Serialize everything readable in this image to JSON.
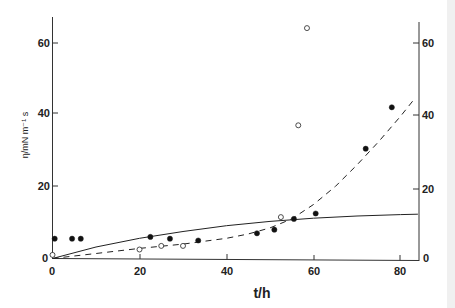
{
  "chart_data": {
    "type": "scatter",
    "title": "",
    "xlabel": "t/h",
    "ylabel": "η/mN m⁻¹ s",
    "xlim": [
      0,
      85
    ],
    "ylim": [
      0,
      68
    ],
    "xticks": [
      "0",
      "20",
      "40",
      "60",
      "80"
    ],
    "yticks_left": [
      "0",
      "20",
      "40",
      "60"
    ],
    "yticks_right": [
      "0",
      "20",
      "40",
      "60"
    ],
    "grid": false,
    "legend": "none",
    "series": [
      {
        "name": "filled circles",
        "marker": "filled-circle",
        "x": [
          0.5,
          4.5,
          6.5,
          22.5,
          27,
          33.5,
          47,
          51,
          55.5,
          60.5,
          72,
          78
        ],
        "y": [
          5.5,
          5.5,
          5.5,
          6,
          5.5,
          5,
          7,
          8,
          11,
          12.5,
          30.5,
          42
        ]
      },
      {
        "name": "open circles",
        "marker": "open-circle",
        "x": [
          0,
          20,
          25,
          30,
          52.5,
          56.5,
          58.5
        ],
        "y": [
          1,
          2.5,
          3.5,
          3.5,
          11.5,
          37,
          64
        ]
      },
      {
        "name": "solid fit curve",
        "style": "solid-line",
        "x": [
          0,
          10,
          20,
          30,
          40,
          50,
          60,
          70,
          80,
          84
        ],
        "y": [
          0,
          3.2,
          5.6,
          7.5,
          9.1,
          10.3,
          11.2,
          11.8,
          12.2,
          12.3
        ]
      },
      {
        "name": "dashed fit curve",
        "style": "dashed-line",
        "x": [
          0,
          10,
          20,
          30,
          40,
          45,
          50,
          55,
          60,
          65,
          70,
          75,
          80,
          83
        ],
        "y": [
          0,
          1.4,
          2.8,
          4,
          5.6,
          6.8,
          8.5,
          11,
          15,
          20,
          26,
          32.5,
          39.5,
          44
        ]
      }
    ]
  }
}
